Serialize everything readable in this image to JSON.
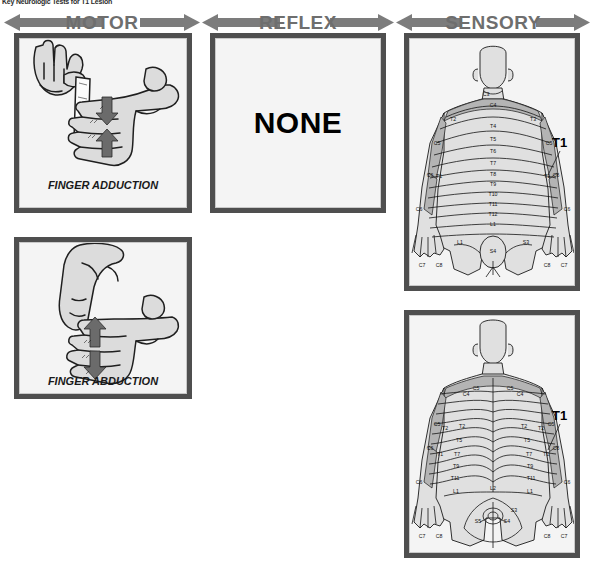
{
  "caption": "Key Neurologic Tests for T1 Lesion",
  "banners": [
    {
      "id": "motor",
      "label": "MOTOR"
    },
    {
      "id": "reflex",
      "label": "REFLEX"
    },
    {
      "id": "sensory",
      "label": "SENSORY"
    }
  ],
  "colors": {
    "banner_bar": "#7c7c7c",
    "banner_text": "#6e6e6e",
    "frame": "#4f4f4f",
    "panel_bg": "#f4f4f4",
    "shadow": "#9a9a9a",
    "skin": "#e0e0e0",
    "dermatome_shade": "#b4b4b4",
    "ink": "#111111"
  },
  "motor": {
    "tests": [
      {
        "id": "finger-adduction",
        "label": "FINGER ADDUCTION",
        "description": "Examiner pulls a sheet of paper held between the patient's extended fingers; arrows show opposing adduction force."
      },
      {
        "id": "finger-abduction",
        "label": "FINGER ABDUCTION",
        "description": "Examiner presses down on a spread finger while the patient resists; arrows show opposing abduction force."
      }
    ]
  },
  "reflex": {
    "value": "NONE"
  },
  "sensory": {
    "views": [
      {
        "id": "anterior",
        "callout": "T1",
        "trunk_labels": [
          "C3",
          "C4",
          "T2",
          "T3",
          "T4",
          "T5",
          "T6",
          "T7",
          "T8",
          "T9",
          "T10",
          "T11",
          "T12",
          "L1",
          "L1",
          "S3",
          "S4"
        ],
        "arm_labels_left": [
          "C5",
          "C6",
          "T1",
          "C6",
          "C7",
          "C8"
        ],
        "arm_labels_right": [
          "C5",
          "C6",
          "T1",
          "C6",
          "C8",
          "C7"
        ]
      },
      {
        "id": "posterior",
        "callout": "T1",
        "trunk_labels": [
          "C4",
          "C5",
          "C5",
          "C4",
          "T2",
          "T2",
          "T5",
          "T5",
          "T7",
          "T7",
          "T9",
          "T9",
          "T11",
          "T11",
          "L1",
          "L2",
          "L1",
          "S3",
          "S4",
          "S5"
        ],
        "arm_labels_left": [
          "C5",
          "T2",
          "C6",
          "T1",
          "C6",
          "C7",
          "C8"
        ],
        "arm_labels_right": [
          "T2",
          "C5",
          "C6",
          "T1",
          "C6",
          "C8",
          "C7"
        ]
      }
    ]
  }
}
